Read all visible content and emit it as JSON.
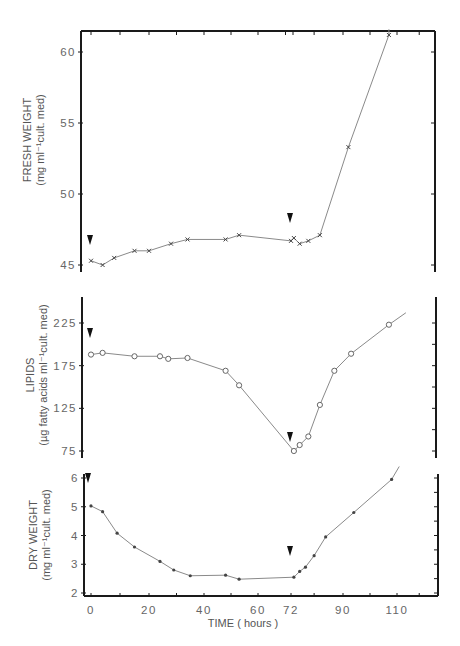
{
  "chart_data": {
    "type": "line",
    "title": "",
    "shared_x": {
      "xlabel": "TIME ( hours )",
      "tick_labels": [
        "0",
        "20",
        "40",
        "60",
        "72",
        "90",
        "110"
      ],
      "tick_values": [
        0,
        20,
        40,
        60,
        72,
        90,
        110
      ],
      "xlim": [
        -3,
        128
      ]
    },
    "panels": [
      {
        "id": "fresh",
        "ylabel_line1": "FRESH WEIGHT",
        "ylabel_line2": "(mg ml⁻¹cult. med)",
        "yticks": [
          45,
          50,
          55,
          60
        ],
        "ytick_labels": [
          "45",
          "50",
          "55",
          "60"
        ],
        "ylim": [
          44.8,
          62
        ],
        "marker": "x",
        "arrows_at_hours": [
          0,
          72
        ],
        "x": [
          0,
          4,
          8,
          15,
          20,
          28,
          34,
          48,
          53,
          72,
          73,
          75,
          78,
          82,
          92,
          107
        ],
        "y": [
          45.3,
          45.0,
          45.5,
          46.0,
          46.0,
          46.5,
          46.8,
          46.8,
          47.1,
          46.7,
          46.9,
          46.5,
          46.7,
          47.1,
          53.3,
          61.2
        ],
        "line_end": [
          107,
          61.6
        ]
      },
      {
        "id": "lipids",
        "ylabel_line1": "LIPIDS",
        "ylabel_line2": "(µg fatty acids  ml⁻¹cult. med)",
        "yticks": [
          75,
          125,
          175,
          225
        ],
        "ytick_labels": [
          "75",
          "125",
          "175",
          "225"
        ],
        "ylim": [
          68,
          255
        ],
        "marker": "o",
        "arrows_at_hours": [
          0,
          72
        ],
        "x": [
          0,
          4,
          15,
          24,
          27,
          34,
          48,
          53,
          73,
          75,
          78,
          82,
          87,
          93,
          107
        ],
        "y": [
          188,
          190,
          186,
          186,
          183,
          184,
          169,
          152,
          75,
          82,
          92,
          129,
          169,
          189,
          223
        ],
        "line_end": [
          114,
          237
        ]
      },
      {
        "id": "dry",
        "ylabel_line1": "DRY WEIGHT",
        "ylabel_line2": "(mg ml⁻¹cult. med)",
        "yticks": [
          2,
          3,
          4,
          5,
          6
        ],
        "ytick_labels": [
          "2",
          "3",
          "4",
          "5",
          "6"
        ],
        "ylim": [
          1.9,
          6.1
        ],
        "marker": "dot",
        "arrows_at_hours": [
          0,
          72
        ],
        "x": [
          0,
          4,
          9,
          15,
          24,
          29,
          35,
          48,
          53,
          73,
          75,
          77,
          80,
          84,
          94,
          108
        ],
        "y": [
          5.03,
          4.83,
          4.08,
          3.6,
          3.1,
          2.8,
          2.6,
          2.62,
          2.48,
          2.55,
          2.75,
          2.9,
          3.3,
          3.95,
          4.8,
          5.95
        ],
        "line_end": [
          111,
          6.4
        ]
      }
    ]
  },
  "style": {
    "axis_color": "#1a1a1a",
    "line_color": "#8a8a8a",
    "marker_color": "#444444",
    "arrow_color": "#111111"
  }
}
